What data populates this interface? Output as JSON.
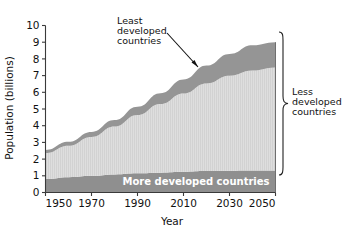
{
  "chart_data": {
    "type": "area",
    "title": "",
    "xlabel": "Year",
    "ylabel": "Population (billions)",
    "xlim": [
      1950,
      2050
    ],
    "ylim": [
      0,
      10
    ],
    "xticks": [
      1950,
      1970,
      1990,
      2010,
      2030,
      2050
    ],
    "yticks": [
      0,
      1,
      2,
      3,
      4,
      5,
      6,
      7,
      8,
      9,
      10
    ],
    "grid": false,
    "legend_position": "in-plot-annotations",
    "stacked": true,
    "x": [
      1950,
      1960,
      1970,
      1980,
      1990,
      2000,
      2010,
      2020,
      2030,
      2040,
      2050
    ],
    "series": [
      {
        "name": "More developed countries",
        "color": "#8f8f8f",
        "values": [
          0.81,
          0.92,
          1.0,
          1.08,
          1.15,
          1.19,
          1.24,
          1.28,
          1.3,
          1.31,
          1.31
        ]
      },
      {
        "name": "Less developed countries",
        "color": "#dcdcdc",
        "values": [
          1.55,
          1.88,
          2.33,
          2.87,
          3.49,
          4.11,
          4.69,
          5.25,
          5.69,
          5.99,
          6.17
        ]
      },
      {
        "name": "Least developed countries",
        "color": "#959595",
        "values": [
          0.19,
          0.24,
          0.3,
          0.39,
          0.5,
          0.65,
          0.84,
          1.07,
          1.31,
          1.52,
          1.52
        ]
      }
    ],
    "totals": [
      2.55,
      3.04,
      3.63,
      4.34,
      5.14,
      5.95,
      6.77,
      7.6,
      8.3,
      8.82,
      9.0
    ],
    "annotations": [
      {
        "name": "least-developed-callout",
        "text": [
          "Least",
          "developed",
          "countries"
        ],
        "points_to": "upper dark band"
      },
      {
        "name": "less-developed-brace",
        "text": [
          "Less",
          "developed",
          "countries"
        ],
        "brace_range_billions": [
          1.31,
          9.0
        ]
      },
      {
        "name": "more-developed-in-band",
        "text": "More developed countries"
      }
    ]
  },
  "labels": {
    "y_axis_title": "Population (billions)",
    "x_axis_title": "Year",
    "yticks": [
      "0",
      "1",
      "2",
      "3",
      "4",
      "5",
      "6",
      "7",
      "8",
      "9",
      "10"
    ],
    "xticks": [
      "1950",
      "1970",
      "1990",
      "2010",
      "2030",
      "2050"
    ],
    "least_line1": "Least",
    "least_line2": "developed",
    "least_line3": "countries",
    "less_line1": "Less",
    "less_line2": "developed",
    "less_line3": "countries",
    "more_developed": "More developed countries"
  },
  "colors": {
    "more_developed": "#8f8f8f",
    "less_developed": "#dcdcdc",
    "least_developed": "#959595",
    "axis": "#3a3a3a",
    "text": "#111111",
    "band_text": "#ffffff",
    "background": "#ffffff"
  }
}
